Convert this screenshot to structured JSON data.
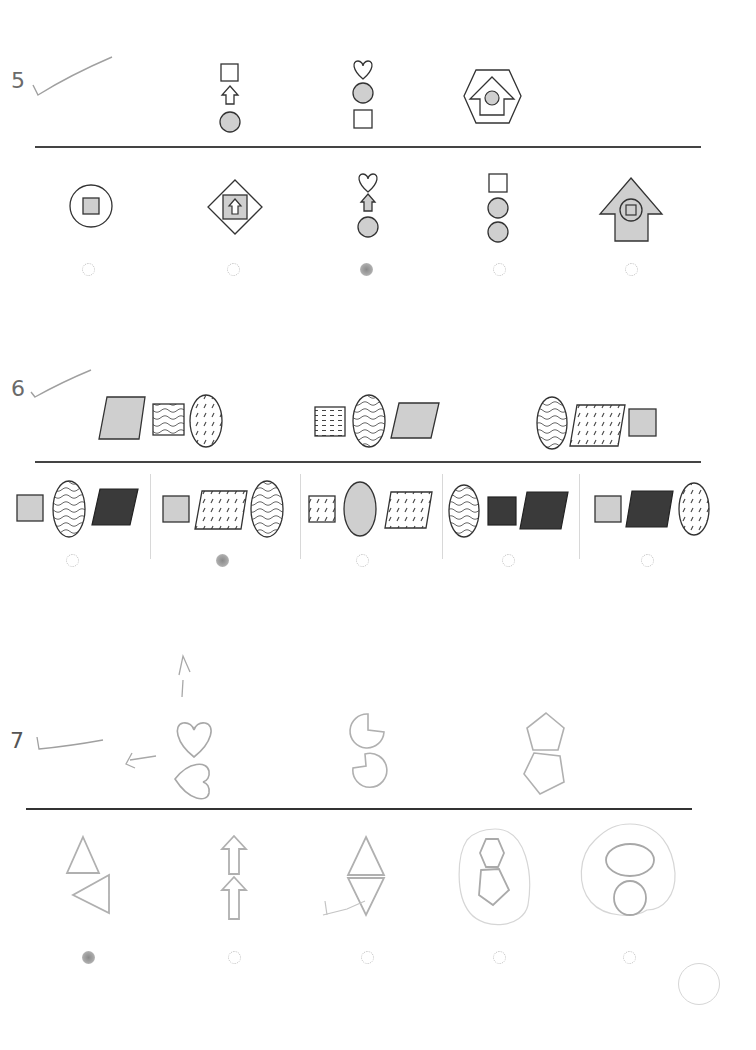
{
  "page": {
    "type": "multiple-choice figure-series worksheet (scanned)",
    "colors": {
      "ink": "#333333",
      "gray_fill": "#cfcfcf",
      "dark_fill": "#3a3a3a",
      "pencil": "#a8a8a8",
      "faint_shape": "#b5b5b5"
    }
  },
  "questions": [
    {
      "number": "5",
      "check_mark": "pencil-checkmark",
      "sequence": [
        {
          "figure": "square-above-up-arrow-above-gray-circle"
        },
        {
          "figure": "heart-above-gray-circle-above-square"
        },
        {
          "figure": "hexagon-containing-arrow-house-containing-gray-circle"
        }
      ],
      "options": [
        {
          "index": 1,
          "figure": "circle-containing-gray-square",
          "selected": false
        },
        {
          "index": 2,
          "figure": "diamond-containing-gray-square-containing-up-arrow",
          "selected": false
        },
        {
          "index": 3,
          "figure": "heart-above-gray-up-arrow-above-gray-circle",
          "selected": true
        },
        {
          "index": 4,
          "figure": "square-above-gray-circle-above-gray-circle",
          "selected": false
        },
        {
          "index": 5,
          "figure": "gray-arrow-house-containing-circle-containing-square",
          "selected": false
        }
      ]
    },
    {
      "number": "6",
      "check_mark": "pencil-checkmark",
      "sequence": [
        {
          "figure": "gray-parallelogram, wavy-square, dashed-oval"
        },
        {
          "figure": "horizontal-dashed-square, wavy-oval, gray-parallelogram"
        },
        {
          "figure": "wavy-oval, dashed-parallelogram, gray-square"
        }
      ],
      "options": [
        {
          "index": 1,
          "figure": "gray-square, wavy-oval, black-parallelogram",
          "selected": false
        },
        {
          "index": 2,
          "figure": "gray-square, dashed-parallelogram, wavy-oval",
          "selected": true
        },
        {
          "index": 3,
          "figure": "dashed-square, gray-oval, dashed-parallelogram",
          "selected": false
        },
        {
          "index": 4,
          "figure": "wavy-oval, black-square, black-parallelogram",
          "selected": false
        },
        {
          "index": 5,
          "figure": "gray-square, black-parallelogram, dashed-oval",
          "selected": false
        }
      ]
    },
    {
      "number": "7",
      "check_mark": "pencil-checkmark",
      "annotations": [
        "pencil-up-arrow",
        "pencil-left-arrow"
      ],
      "sequence": [
        {
          "figure": "heart-above-heart-rotated-90"
        },
        {
          "figure": "pacman-above-pacman-rotated"
        },
        {
          "figure": "pentagon-above-pentagon-rotated"
        }
      ],
      "options": [
        {
          "index": 1,
          "figure": "triangle-above-triangle-pointing-left",
          "selected": true
        },
        {
          "index": 2,
          "figure": "up-arrow-above-up-arrow",
          "selected": false
        },
        {
          "index": 3,
          "figure": "triangle-above-inverted-triangle",
          "selected": false
        },
        {
          "index": 4,
          "figure": "hexagon-above-pentagon (circled in pencil)",
          "selected": false
        },
        {
          "index": 5,
          "figure": "ellipse-above-circle (circled in pencil)",
          "selected": false
        }
      ]
    }
  ]
}
